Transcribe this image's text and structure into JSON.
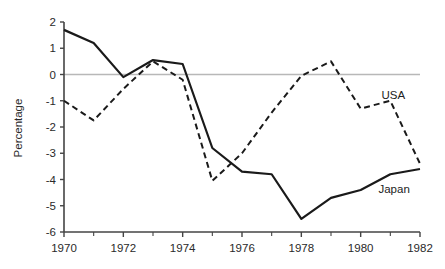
{
  "chart_data": {
    "type": "line",
    "title": "",
    "xlabel": "",
    "ylabel": "Percentage",
    "xlim": [
      1970,
      1982
    ],
    "ylim": [
      -6,
      2
    ],
    "grid": false,
    "zero_line": true,
    "legend_position": "inline-end-of-line",
    "x": [
      1970,
      1971,
      1972,
      1973,
      1974,
      1975,
      1976,
      1977,
      1978,
      1979,
      1980,
      1981,
      1982
    ],
    "xtick_labels": [
      "1970",
      "1972",
      "1974",
      "1976",
      "1978",
      "1980",
      "1982"
    ],
    "xticks_major": [
      1970,
      1972,
      1974,
      1976,
      1978,
      1980,
      1982
    ],
    "xticks_minor": [
      1971,
      1973,
      1975,
      1977,
      1979,
      1981
    ],
    "ytick_labels": [
      "2",
      "1",
      "0",
      "-1",
      "-2",
      "-3",
      "-4",
      "-5",
      "-6"
    ],
    "yticks": [
      2,
      1,
      0,
      -1,
      -2,
      -3,
      -4,
      -5,
      -6
    ],
    "series": [
      {
        "name": "Japan",
        "style": "solid",
        "color": "#1a1a1a",
        "label_text": "Japan",
        "label_x": 1980.6,
        "label_y": -4.35,
        "values": [
          1.7,
          1.2,
          -0.1,
          0.55,
          0.4,
          -2.8,
          -3.7,
          -3.8,
          -5.5,
          -4.7,
          -4.4,
          -3.8,
          -3.6
        ]
      },
      {
        "name": "USA",
        "style": "dashed",
        "color": "#1a1a1a",
        "label_text": "USA",
        "label_x": 1980.7,
        "label_y": -0.78,
        "values": [
          -1.0,
          -1.75,
          -0.55,
          0.5,
          -0.2,
          -4.05,
          -3.0,
          -1.45,
          -0.05,
          0.5,
          -1.3,
          -1.0,
          -3.4
        ]
      }
    ]
  },
  "axes": {
    "axis_color": "#444444",
    "zero_line_color": "#b8b8b8",
    "tick_color": "#444444"
  }
}
